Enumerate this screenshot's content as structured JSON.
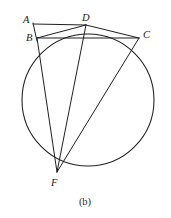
{
  "figure": {
    "caption": "(b)",
    "type": "euclidean-circle-diagram",
    "stroke_color": "#1f1f1f",
    "background_color": "#ffffff",
    "label_color": "#1a1a1a"
  },
  "circle": {
    "name": "main-circle",
    "center_x": 88,
    "center_y": 100,
    "radius": 66
  },
  "points": [
    {
      "id": "A",
      "label": "A",
      "x": 33,
      "y": 24,
      "label_x": 23,
      "label_y": 23,
      "on_circle": false
    },
    {
      "id": "B",
      "label": "B",
      "x": 37,
      "y": 38,
      "label_x": 26,
      "label_y": 41,
      "on_circle": true
    },
    {
      "id": "D",
      "label": "D",
      "x": 86,
      "y": 25,
      "label_x": 82,
      "label_y": 21,
      "on_circle": true
    },
    {
      "id": "C",
      "label": "C",
      "x": 139,
      "y": 38,
      "label_x": 143,
      "label_y": 38,
      "on_circle": true
    },
    {
      "id": "F",
      "label": "F",
      "x": 57,
      "y": 172,
      "label_x": 51,
      "label_y": 186,
      "on_circle": true
    }
  ],
  "segments": [
    {
      "id": "AD",
      "from": "A",
      "to": "D",
      "description": "horizontal line from A to D"
    },
    {
      "id": "AB",
      "from": "A",
      "to": "B",
      "description": "short vertical line from A down to B"
    },
    {
      "id": "BC",
      "from": "B",
      "to": "C",
      "description": "horizontal chord from B to C"
    },
    {
      "id": "BD",
      "from": "B",
      "to": "D",
      "description": "chord from B to D"
    },
    {
      "id": "DC",
      "from": "D",
      "to": "C",
      "description": "chord from D to C"
    },
    {
      "id": "BF",
      "from": "B",
      "to": "F",
      "description": "chord from B to F"
    },
    {
      "id": "DF",
      "from": "D",
      "to": "F",
      "description": "chord from D to F"
    },
    {
      "id": "CF",
      "from": "C",
      "to": "F",
      "description": "chord from C to F"
    }
  ],
  "caption": {
    "text": "(b)",
    "x": 85,
    "y": 205
  }
}
